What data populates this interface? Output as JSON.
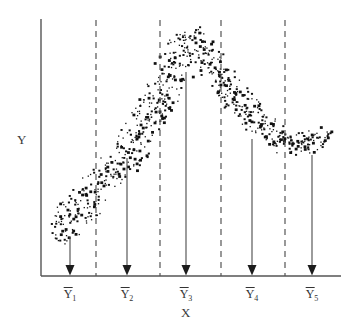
{
  "figure": {
    "title": "",
    "y_axis_label": "Y",
    "x_axis_label": "X"
  },
  "chart_data": {
    "type": "scatter",
    "title": "",
    "xlabel": "X",
    "ylabel": "Y",
    "grid": false,
    "legend": null,
    "xlim": [
      0,
      10
    ],
    "ylim": [
      0,
      10
    ],
    "axes": {
      "y_axis_x_px": 41,
      "y_axis_top_px": 19,
      "x_axis_y_px": 276,
      "x_axis_left_px": 41,
      "x_axis_right_px": 341,
      "axis_color": "#555555"
    },
    "dividers": {
      "style": "dashed",
      "color": "#555555",
      "top_px": 20,
      "bottom_px": 276,
      "x_px": [
        96,
        160,
        221,
        285
      ]
    },
    "groups": [
      {
        "label": "Ȳ1",
        "tex": "\\bar{Y}_1",
        "base": "Y",
        "subscript": "1",
        "arrow_x_px": 70,
        "arrow_top_px": 237,
        "arrow_bottom_px": 276,
        "band_center_y_px": 218
      },
      {
        "label": "Ȳ2",
        "tex": "\\bar{Y}_2",
        "base": "Y",
        "subscript": "2",
        "arrow_x_px": 127,
        "arrow_top_px": 158,
        "arrow_bottom_px": 276,
        "band_center_y_px": 140
      },
      {
        "label": "Ȳ3",
        "tex": "\\bar{Y}_3",
        "base": "Y",
        "subscript": "3",
        "arrow_x_px": 186,
        "arrow_top_px": 72,
        "arrow_bottom_px": 276,
        "band_center_y_px": 52
      },
      {
        "label": "Ȳ4",
        "tex": "\\bar{Y}_4",
        "base": "Y",
        "subscript": "4",
        "arrow_x_px": 252,
        "arrow_top_px": 139,
        "arrow_bottom_px": 276,
        "band_center_y_px": 120
      },
      {
        "label": "Ȳ5",
        "tex": "\\bar{Y}_5",
        "base": "Y",
        "subscript": "5",
        "arrow_x_px": 312,
        "arrow_top_px": 155,
        "arrow_bottom_px": 276,
        "band_center_y_px": 138
      }
    ],
    "band": {
      "marker_color": "#111111",
      "marker_count": 760,
      "spine_points_px": [
        [
          52,
          238
        ],
        [
          75,
          214
        ],
        [
          100,
          187
        ],
        [
          125,
          157
        ],
        [
          150,
          120
        ],
        [
          172,
          75
        ],
        [
          190,
          35
        ],
        [
          205,
          52
        ],
        [
          225,
          83
        ],
        [
          248,
          113
        ],
        [
          270,
          130
        ],
        [
          288,
          142
        ],
        [
          305,
          140
        ],
        [
          322,
          140
        ],
        [
          332,
          143
        ]
      ],
      "half_thickness_px": [
        16,
        17,
        18,
        18,
        19,
        20,
        16,
        15,
        15,
        15,
        15,
        14,
        13,
        13,
        11
      ]
    }
  }
}
